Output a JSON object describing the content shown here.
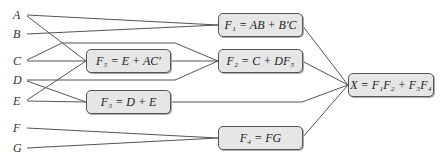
{
  "inputs": [
    {
      "name": "A"
    },
    {
      "name": "B"
    },
    {
      "name": "C"
    },
    {
      "name": "D"
    },
    {
      "name": "E"
    },
    {
      "name": "F"
    },
    {
      "name": "G"
    }
  ],
  "blocks": {
    "f1": {
      "label": "F₁ = AB + B′C"
    },
    "f2": {
      "label": "F₂ = C + DF₅"
    },
    "f3": {
      "label": "F₃ = D + E"
    },
    "f4": {
      "label": "F₄ = FG"
    },
    "f5": {
      "label": "F₅ = E + AC′"
    },
    "x": {
      "label": "X = F₁F₂ + F₃F₄"
    }
  },
  "connections": [
    [
      "A",
      "F1"
    ],
    [
      "B",
      "F1"
    ],
    [
      "A",
      "F5"
    ],
    [
      "C",
      "F5"
    ],
    [
      "E",
      "F5"
    ],
    [
      "C",
      "F2"
    ],
    [
      "F5",
      "F2"
    ],
    [
      "D",
      "F2"
    ],
    [
      "D",
      "F3"
    ],
    [
      "E",
      "F3"
    ],
    [
      "F",
      "F4"
    ],
    [
      "G",
      "F4"
    ],
    [
      "F1",
      "X"
    ],
    [
      "F2",
      "X"
    ],
    [
      "F3",
      "X"
    ],
    [
      "F4",
      "X"
    ]
  ]
}
